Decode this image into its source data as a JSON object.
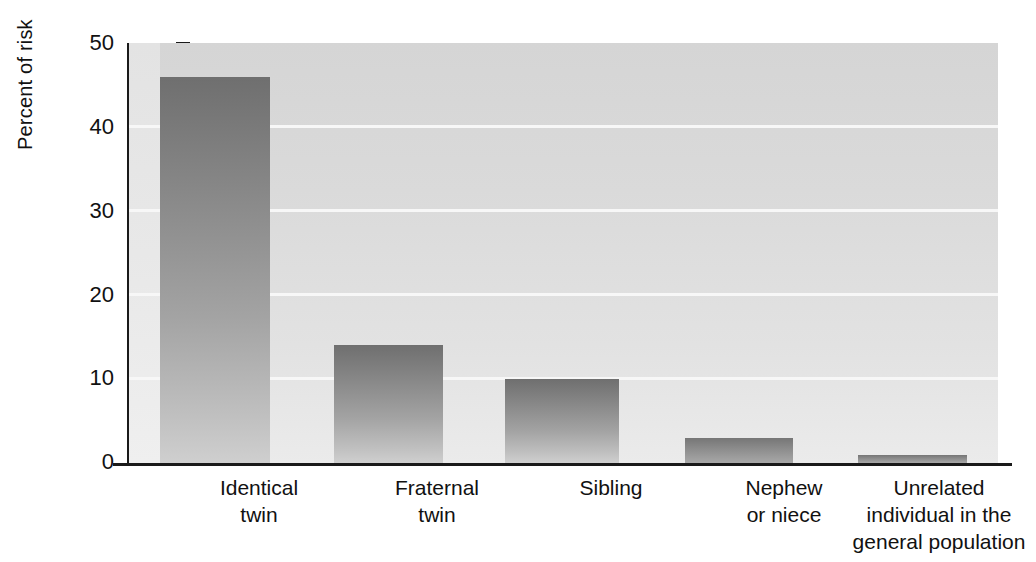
{
  "chart_data": {
    "type": "bar",
    "title": "",
    "subtitle": "",
    "xlabel": "",
    "ylabel": "Percent of risk",
    "ylim": [
      0,
      50
    ],
    "ytick_values": [
      0,
      10,
      20,
      30,
      40,
      50
    ],
    "ytick_labels": [
      "0",
      "10",
      "20",
      "30",
      "40",
      "50"
    ],
    "grid": "horizontal",
    "legend": null,
    "categories": [
      "Identical twin",
      "Fraternal twin",
      "Sibling",
      "Nephew or niece",
      "Unrelated individual in the general population"
    ],
    "category_lines": [
      [
        "Identical",
        "twin"
      ],
      [
        "Fraternal",
        "twin"
      ],
      [
        "Sibling"
      ],
      [
        "Nephew",
        "or niece"
      ],
      [
        "Unrelated",
        "individual in the",
        "general population"
      ]
    ],
    "values": [
      46,
      14,
      10,
      3,
      1
    ],
    "value_unit": "percent",
    "bar_color_top": "#6f6f6f",
    "bar_color_bottom": "#cfcfcf",
    "panel_background": "#dcdcdc",
    "gridline_color": "#f7f7f7",
    "axis_color": "#1a1a1a"
  },
  "axis": {
    "y_title": "Percent of risk",
    "ticks": [
      {
        "label": "50",
        "value": 50
      },
      {
        "label": "40",
        "value": 40
      },
      {
        "label": "30",
        "value": 30
      },
      {
        "label": "20",
        "value": 20
      },
      {
        "label": "10",
        "value": 10
      },
      {
        "label": "0",
        "value": 0
      }
    ]
  },
  "bars": [
    {
      "label_line1": "Identical",
      "label_line2": "twin",
      "label_line3": "",
      "value": 46
    },
    {
      "label_line1": "Fraternal",
      "label_line2": "twin",
      "label_line3": "",
      "value": 14
    },
    {
      "label_line1": "Sibling",
      "label_line2": "",
      "label_line3": "",
      "value": 10
    },
    {
      "label_line1": "Nephew",
      "label_line2": "or niece",
      "label_line3": "",
      "value": 3
    },
    {
      "label_line1": "Unrelated",
      "label_line2": "individual in the",
      "label_line3": "general population",
      "value": 1
    }
  ]
}
